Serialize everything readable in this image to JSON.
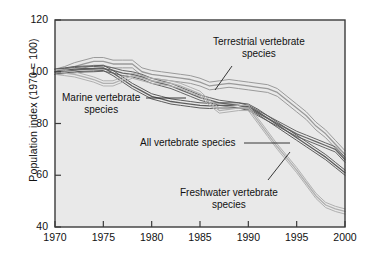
{
  "figure": {
    "background": "#ffffff",
    "plot_background": "#e9e9e9",
    "frame_color": "#3b3b3b"
  },
  "axis": {
    "y_label": "Population index (1970 = 100)",
    "y_ticks": [
      "120",
      "100",
      "80",
      "60",
      "40"
    ],
    "x_ticks": [
      "1970",
      "1975",
      "1980",
      "1985",
      "1990",
      "1995",
      "2000"
    ]
  },
  "annotations": {
    "terrestrial": {
      "line1": "Terrestrial vertebrate",
      "line2": "species"
    },
    "marine": {
      "line1": "Marine vertebrate",
      "line2": "species"
    },
    "all": {
      "line1": "All vertebrate species",
      "line2": ""
    },
    "freshwater": {
      "line1": "Freshwater vertebrate",
      "line2": "species"
    }
  },
  "chart_data": {
    "type": "line",
    "title": "",
    "xlabel": "",
    "ylabel": "Population index (1970 = 100)",
    "xlim": [
      1970,
      2000
    ],
    "ylim": [
      40,
      120
    ],
    "xticks": [
      1970,
      1975,
      1980,
      1985,
      1990,
      1995,
      2000
    ],
    "yticks": [
      40,
      60,
      80,
      100,
      120
    ],
    "grid": false,
    "legend": "inline-annotations",
    "x": [
      1970,
      1971,
      1972,
      1973,
      1974,
      1975,
      1976,
      1977,
      1978,
      1979,
      1980,
      1981,
      1982,
      1983,
      1984,
      1985,
      1986,
      1987,
      1988,
      1989,
      1990,
      1991,
      1992,
      1993,
      1994,
      1995,
      1996,
      1997,
      1998,
      1999,
      2000
    ],
    "series": [
      {
        "name": "Terrestrial vertebrate species",
        "color": "#9a9a9a",
        "band": true,
        "values": [
          100,
          101,
          102,
          103,
          104,
          104,
          103,
          103,
          103,
          100,
          99,
          98.5,
          98,
          97.5,
          97,
          96,
          94.5,
          95,
          95.5,
          95,
          94.5,
          94,
          93.5,
          92,
          89,
          86,
          83,
          79,
          76,
          72,
          68
        ],
        "values_upper": [
          101,
          102,
          103.5,
          104.5,
          105.5,
          105.5,
          104.5,
          104.5,
          104.5,
          101.5,
          100.5,
          100,
          99.5,
          99,
          98.5,
          97.5,
          96,
          96.5,
          97,
          96.5,
          96,
          95.5,
          95,
          93.5,
          90.5,
          87.5,
          84.5,
          80.5,
          77.5,
          73.5,
          69.5
        ],
        "values_lower": [
          99,
          100,
          100.5,
          101.5,
          102.5,
          102.5,
          101.5,
          101.5,
          101.5,
          98.5,
          97.5,
          97,
          96.5,
          96,
          95.5,
          94.5,
          93,
          93.5,
          94,
          93.5,
          93,
          92.5,
          92,
          90.5,
          87.5,
          84.5,
          81.5,
          77.5,
          74.5,
          70.5,
          66.5
        ]
      },
      {
        "name": "All vertebrate species",
        "color": "#666666",
        "band": true,
        "values": [
          100,
          100.3,
          100.6,
          100.9,
          101,
          101.2,
          100.5,
          99.5,
          99,
          98,
          96.5,
          95.5,
          94.5,
          93,
          91.5,
          90,
          89,
          88,
          87.5,
          87,
          86,
          84,
          82,
          80,
          78,
          76,
          74.5,
          73,
          71.5,
          70,
          66
        ],
        "values_upper": [
          101,
          101.3,
          101.6,
          101.9,
          102,
          102.2,
          101.5,
          100.5,
          100,
          99,
          97.5,
          96.5,
          95.5,
          94,
          92.5,
          91,
          90,
          89,
          88.5,
          88,
          87,
          85,
          83,
          81,
          79,
          77,
          75.5,
          74,
          72.5,
          71,
          67
        ],
        "values_lower": [
          99,
          99.3,
          99.6,
          99.9,
          100,
          100.2,
          99.5,
          98.5,
          98,
          97,
          95.5,
          94.5,
          93.5,
          92,
          90.5,
          89,
          88,
          87,
          86.5,
          86,
          85,
          83,
          81,
          79,
          77,
          75,
          73.5,
          72,
          70.5,
          69,
          65
        ]
      },
      {
        "name": "Marine vertebrate species",
        "color": "#5c5c5c",
        "band": true,
        "values": [
          100,
          100.5,
          101,
          101.2,
          101.3,
          101.5,
          99.5,
          97,
          94.5,
          92.5,
          90.5,
          89.5,
          88.5,
          88,
          87.5,
          87,
          86.8,
          87,
          87,
          87,
          86.5,
          84.5,
          82,
          79.5,
          77,
          74.5,
          72,
          69.5,
          67,
          64,
          61
        ],
        "values_upper": [
          101,
          101.5,
          102,
          102.2,
          102.3,
          102.5,
          100.5,
          98,
          95.5,
          93.5,
          91.5,
          90.5,
          89.5,
          89,
          88.5,
          88,
          87.8,
          88,
          88,
          88,
          87.5,
          85.5,
          83,
          80.5,
          78,
          75.5,
          73,
          70.5,
          68,
          65,
          62
        ],
        "values_lower": [
          99,
          99.5,
          100,
          100.2,
          100.3,
          100.5,
          98.5,
          96,
          93.5,
          91.5,
          89.5,
          88.5,
          87.5,
          87,
          86.5,
          86,
          85.8,
          86,
          86,
          86,
          85.5,
          83.5,
          81,
          78.5,
          76,
          73.5,
          71,
          68.5,
          66,
          63,
          60
        ]
      },
      {
        "name": "Freshwater vertebrate species",
        "color": "#b0b0b0",
        "band": true,
        "values": [
          100,
          99.5,
          99,
          98,
          97,
          95.5,
          95.5,
          97,
          98.5,
          97.5,
          96.5,
          96,
          95.5,
          94.5,
          93,
          91.5,
          88,
          85,
          85.5,
          86,
          86,
          81,
          76,
          71,
          66.5,
          62,
          57,
          52,
          48.5,
          47,
          46
        ],
        "values_upper": [
          101,
          100.5,
          100,
          99,
          98,
          96.5,
          96.5,
          98,
          99.5,
          98.5,
          97.5,
          97,
          96.5,
          95.5,
          94,
          92.5,
          89,
          86,
          86.5,
          87,
          87,
          82,
          77,
          72,
          67.5,
          63,
          58,
          53,
          49.5,
          48,
          47
        ],
        "values_lower": [
          99,
          98.5,
          98,
          97,
          96,
          94.5,
          94.5,
          96,
          97.5,
          96.5,
          95.5,
          95,
          94.5,
          93.5,
          92,
          90.5,
          87,
          84,
          84.5,
          85,
          85,
          80,
          75,
          70,
          65.5,
          61,
          56,
          51,
          47.5,
          46,
          45
        ]
      }
    ]
  }
}
